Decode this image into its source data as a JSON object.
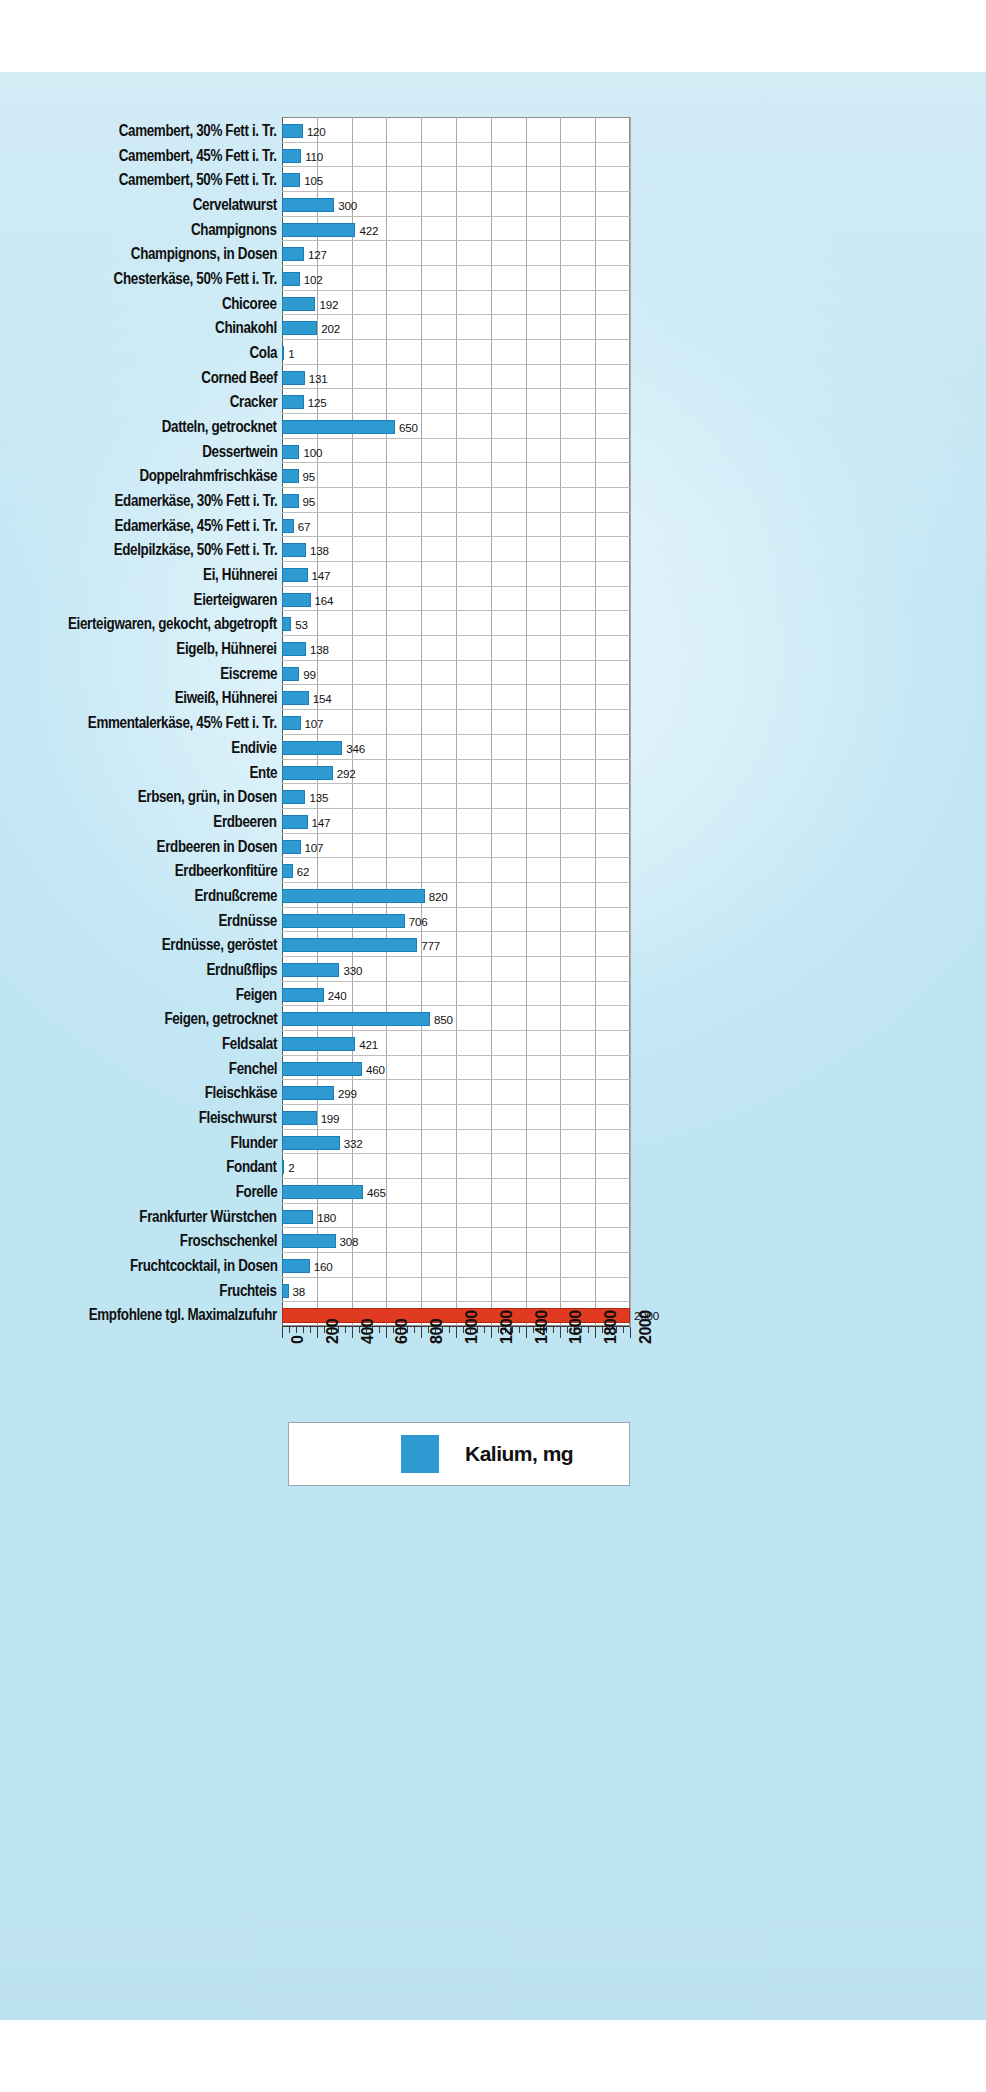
{
  "chart_data": {
    "type": "bar",
    "orientation": "horizontal",
    "title": "",
    "xlabel": "",
    "ylabel": "",
    "xlim": [
      0,
      2000
    ],
    "xticks": [
      0,
      200,
      400,
      600,
      800,
      1000,
      1200,
      1400,
      1600,
      1800,
      2000
    ],
    "xtick_labels": [
      "0",
      "200",
      "400",
      "600",
      "800",
      "1000",
      "1200",
      "1400",
      "1600",
      "1800",
      "2000"
    ],
    "grid": true,
    "legend": {
      "position": "bottom",
      "label": "Kalium, mg",
      "color": "#2e9ad1"
    },
    "bar_color": "#2e9ad1",
    "reference_bar_color": "#e03a20",
    "unit": "mg",
    "categories": [
      "Camembert, 30% Fett i. Tr.",
      "Camembert, 45% Fett i. Tr.",
      "Camembert, 50% Fett i. Tr.",
      "Cervelatwurst",
      "Champignons",
      "Champignons, in Dosen",
      "Chesterkäse, 50% Fett i. Tr.",
      "Chicoree",
      "Chinakohl",
      "Cola",
      "Corned Beef",
      "Cracker",
      "Datteln, getrocknet",
      "Dessertwein",
      "Doppelrahmfrischkäse",
      "Edamerkäse, 30% Fett i. Tr.",
      "Edamerkäse, 45% Fett i. Tr.",
      "Edelpilzkäse, 50% Fett i. Tr.",
      "Ei, Hühnerei",
      "Eierteigwaren",
      "Eierteigwaren, gekocht, abgetropft",
      "Eigelb, Hühnerei",
      "Eiscreme",
      "Eiweiß, Hühnerei",
      "Emmentalerkäse, 45% Fett i. Tr.",
      "Endivie",
      "Ente",
      "Erbsen, grün, in Dosen",
      "Erdbeeren",
      "Erdbeeren in Dosen",
      "Erdbeerkonfitüre",
      "Erdnußcreme",
      "Erdnüsse",
      "Erdnüsse, geröstet",
      "Erdnußflips",
      "Feigen",
      "Feigen, getrocknet",
      "Feldsalat",
      "Fenchel",
      "Fleischkäse",
      "Fleischwurst",
      "Flunder",
      "Fondant",
      "Forelle",
      "Frankfurter Würstchen",
      "Froschschenkel",
      "Fruchtcocktail, in Dosen",
      "Fruchteis",
      "Empfohlene tgl. Maximalzufuhr"
    ],
    "values": [
      120,
      110,
      105,
      300,
      422,
      127,
      102,
      192,
      202,
      1,
      131,
      125,
      650,
      100,
      95,
      95,
      67,
      138,
      147,
      164,
      53,
      138,
      99,
      154,
      107,
      346,
      292,
      135,
      147,
      107,
      62,
      820,
      706,
      777,
      330,
      240,
      850,
      421,
      460,
      299,
      199,
      332,
      2,
      465,
      180,
      308,
      160,
      38,
      2000
    ],
    "reference_index": 48
  }
}
